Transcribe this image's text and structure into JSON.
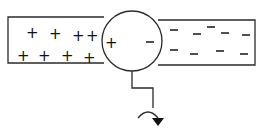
{
  "diagram": {
    "left_bar": {
      "charge_symbol": "+",
      "charges": [
        {
          "x": 31,
          "y": 33
        },
        {
          "x": 54,
          "y": 34
        },
        {
          "x": 77,
          "y": 36
        },
        {
          "x": 91,
          "y": 36
        },
        {
          "x": 22,
          "y": 56
        },
        {
          "x": 43,
          "y": 56
        },
        {
          "x": 66,
          "y": 56
        },
        {
          "x": 88,
          "y": 58
        }
      ]
    },
    "circle": {
      "left_label": "+",
      "right_label": "−"
    },
    "right_bar": {
      "charge_symbol": "−",
      "charges": [
        {
          "x": 174,
          "y": 30
        },
        {
          "x": 197,
          "y": 34
        },
        {
          "x": 211,
          "y": 27
        },
        {
          "x": 225,
          "y": 33
        },
        {
          "x": 246,
          "y": 35
        },
        {
          "x": 174,
          "y": 50
        },
        {
          "x": 194,
          "y": 54
        },
        {
          "x": 220,
          "y": 51
        },
        {
          "x": 244,
          "y": 54
        }
      ]
    },
    "ground": {
      "arrow": "curved-arrow-down"
    }
  }
}
